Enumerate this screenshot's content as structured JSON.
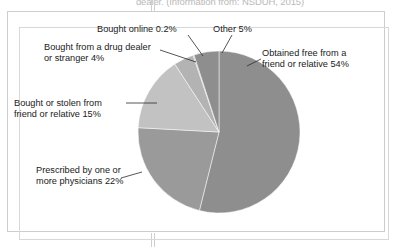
{
  "page": {
    "top_caption": "dealer. (Information from: NSDUH, 2015)"
  },
  "figure": {
    "labels": {
      "bought_online": "Bought online 0.2%",
      "other": "Other 5%",
      "drug_dealer_line1": "Bought from a drug dealer",
      "drug_dealer_line2": "or stranger 4%",
      "obtained_free_line1": "Obtained free from a",
      "obtained_free_line2": "friend or relative 54%",
      "bought_stolen_line1": "Bought or stolen from",
      "bought_stolen_line2": "friend or relative 15%",
      "prescribed_line1": "Prescribed by one or",
      "prescribed_line2": "more physicians 22%"
    }
  },
  "chart_data": {
    "type": "pie",
    "title": "",
    "legend_position": "callout-labels",
    "start_angle_deg": 0,
    "direction": "clockwise",
    "labels": [
      "Obtained free from a friend or relative",
      "Prescribed by one or more physicians",
      "Bought or stolen from friend or relative",
      "Bought from a drug dealer or stranger",
      "Bought online",
      "Other"
    ],
    "values": [
      54,
      22,
      15,
      4,
      0.2,
      5
    ],
    "unit": "%",
    "colors": [
      "#8e8e8e",
      "#9a9a9a",
      "#c2c2c2",
      "#b3b3b3",
      "#a8a8a8",
      "#8e8e8e"
    ],
    "data_labels": [
      "Obtained free from a friend or relative 54%",
      "Prescribed by one or more physicians 22%",
      "Bought or stolen from friend or relative 15%",
      "Bought from a drug dealer or stranger 4%",
      "Bought online 0.2%",
      "Other 5%"
    ]
  }
}
